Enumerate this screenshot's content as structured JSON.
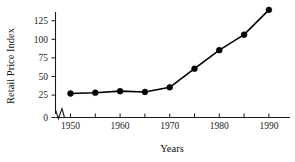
{
  "chart_data": {
    "type": "line",
    "title": "",
    "xlabel": "Years",
    "ylabel": "Retail Price Index",
    "x": [
      1950,
      1955,
      1960,
      1965,
      1970,
      1975,
      1980,
      1985,
      1990
    ],
    "values": [
      31,
      32,
      34,
      33,
      39,
      63,
      87,
      107,
      139
    ],
    "series": [
      {
        "name": "Retail Price Index",
        "values": [
          31,
          32,
          34,
          33,
          39,
          63,
          87,
          107,
          139
        ]
      }
    ],
    "xlim": [
      1948,
      1994
    ],
    "ylim": [
      0,
      140
    ],
    "x_tick_labels": [
      "1950",
      "1960",
      "1970",
      "1980",
      "1990"
    ],
    "x_tick_values": [
      1950,
      1960,
      1970,
      1980,
      1990
    ],
    "x_minor_tick_values": [
      1955,
      1965,
      1975,
      1985
    ],
    "y_tick_labels": [
      "0",
      "25",
      "50",
      "75",
      "100",
      "125"
    ],
    "y_tick_values": [
      0,
      25,
      50,
      75,
      100,
      125
    ],
    "grid": false,
    "legend": false,
    "axis_break": true,
    "marker": "filled-circle",
    "line_color": "#000000",
    "marker_color": "#000000",
    "axis_color": "#1a1a1a",
    "background_color": "#ffffff"
  }
}
